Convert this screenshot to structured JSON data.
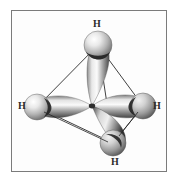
{
  "figure": {
    "molecule": "CH4",
    "geometry": "tetrahedral",
    "style": "grayscale shaded 3D orbital rendering",
    "background_color": "#ffffff",
    "border_color": "#7b7b7b",
    "orbital_color_light": "#f2f2f2",
    "orbital_color_mid": "#9a9a9a",
    "orbital_color_dark": "#3a3a3a",
    "sphere_color_light": "#f6f6f6",
    "sphere_color_dark": "#6e6e6e",
    "bond_line_color": "#2a2a2a"
  },
  "labels": {
    "h_top": "H",
    "h_left": "H",
    "h_right": "H",
    "h_bottom": "H"
  },
  "atoms": [
    {
      "id": "h-top",
      "element": "H",
      "x": 98,
      "y": 45,
      "radius": 14
    },
    {
      "id": "h-left",
      "element": "H",
      "x": 37,
      "y": 107,
      "radius": 13
    },
    {
      "id": "h-right",
      "element": "H",
      "x": 143,
      "y": 106,
      "radius": 13
    },
    {
      "id": "h-bottom",
      "element": "H",
      "x": 113,
      "y": 143,
      "radius": 13
    },
    {
      "id": "c-center",
      "element": "C",
      "x": 92,
      "y": 106,
      "radius": 3
    }
  ],
  "bonds": [
    {
      "from": "h-top",
      "to": "h-left"
    },
    {
      "from": "h-top",
      "to": "h-right"
    },
    {
      "from": "h-top",
      "to": "h-bottom"
    },
    {
      "from": "h-left",
      "to": "h-right"
    },
    {
      "from": "h-left",
      "to": "h-bottom"
    },
    {
      "from": "h-right",
      "to": "h-bottom"
    }
  ],
  "orbitals": [
    {
      "id": "lobe-up",
      "points_to": "h-top",
      "label": "sp3 hybrid orbital"
    },
    {
      "id": "lobe-left",
      "points_to": "h-left",
      "label": "sp3 hybrid orbital"
    },
    {
      "id": "lobe-right",
      "points_to": "h-right",
      "label": "sp3 hybrid orbital"
    },
    {
      "id": "lobe-down",
      "points_to": "h-bottom",
      "label": "sp3 hybrid orbital"
    }
  ]
}
